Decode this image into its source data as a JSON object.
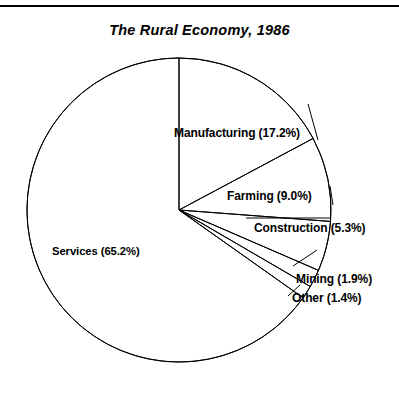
{
  "figure": {
    "title": "The Rural Economy, 1986",
    "has_top_rule": true,
    "line_color": "#000000",
    "background_color": "#ffffff"
  },
  "labels": {
    "services": "Services (65.2%)",
    "manufacturing": "Manufacturing (17.2%)",
    "farming": "Farming (9.0%)",
    "construction": "Construction (5.3%)",
    "mining": "Mining (1.9%)",
    "other": "Other (1.4%)"
  },
  "chart_data": {
    "type": "pie",
    "title": "The Rural Economy, 1986",
    "xlabel": "",
    "ylabel": "",
    "categories": [
      "Manufacturing",
      "Farming",
      "Construction",
      "Mining",
      "Other",
      "Services"
    ],
    "values": [
      17.2,
      9.0,
      5.3,
      1.9,
      1.4,
      65.2
    ],
    "value_unit": "percent",
    "labels": [
      "Manufacturing (17.2%)",
      "Farming (9.0%)",
      "Construction (5.3%)",
      "Mining (1.9%)",
      "Other (1.4%)",
      "Services (65.2%)"
    ],
    "start_angle_deg": 90,
    "direction": "clockwise",
    "slice_fill": "none",
    "slice_stroke": "#000000",
    "legend": "none",
    "grid": false,
    "total": 100.0
  },
  "geometry": {
    "center_x": 179,
    "center_y": 210,
    "radius": 152
  }
}
